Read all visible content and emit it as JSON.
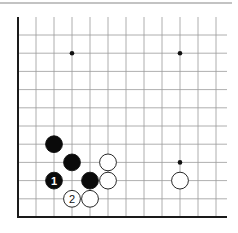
{
  "diagram": {
    "type": "go-board-corner",
    "grid": {
      "origin_x": 18,
      "origin_y": 217,
      "spacing_x": 18,
      "spacing_y": 18.2,
      "cols": 12,
      "rows": 11,
      "line_color": "#9a9a9a",
      "edge_color": "#1a1a1a"
    },
    "top_rule_color": "#888888",
    "hoshi": [
      {
        "col": 3,
        "row": 9
      },
      {
        "col": 9,
        "row": 9
      },
      {
        "col": 9,
        "row": 3
      }
    ],
    "stones": [
      {
        "color": "black",
        "col": 2,
        "row": 4,
        "label": ""
      },
      {
        "color": "black",
        "col": 3,
        "row": 3,
        "label": ""
      },
      {
        "color": "black",
        "col": 2,
        "row": 2,
        "label": "1"
      },
      {
        "color": "black",
        "col": 4,
        "row": 2,
        "label": ""
      },
      {
        "color": "white",
        "col": 5,
        "row": 3,
        "label": ""
      },
      {
        "color": "white",
        "col": 5,
        "row": 2,
        "label": ""
      },
      {
        "color": "white",
        "col": 3,
        "row": 1,
        "label": "2"
      },
      {
        "color": "white",
        "col": 4,
        "row": 1,
        "label": ""
      },
      {
        "color": "white",
        "col": 9,
        "row": 2,
        "label": ""
      }
    ]
  }
}
